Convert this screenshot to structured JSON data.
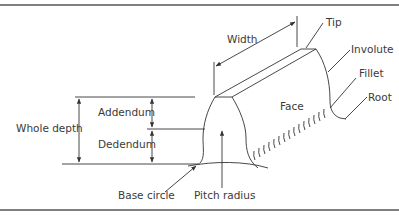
{
  "diagram": {
    "labels": {
      "width": "Width",
      "tip": "Tip",
      "involute": "Involute",
      "fillet": "Fillet",
      "root": "Root",
      "face": "Face",
      "addendum": "Addendum",
      "dedendum": "Dedendum",
      "whole_depth": "Whole depth",
      "base_circle": "Base circle",
      "pitch_radius": "Pitch radius"
    },
    "colors": {
      "line": "#333333",
      "text": "#3a3a3a",
      "rule": "#555555",
      "background": "#ffffff"
    }
  }
}
